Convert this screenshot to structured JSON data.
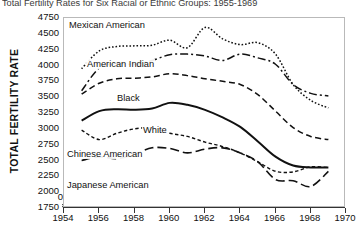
{
  "chart_data": {
    "type": "line",
    "title": "Total Fertility Rates for Six Racial or Ethnic Groups: 1955-1969",
    "xlabel": "",
    "ylabel": "TOTAL FERTILITY RATE",
    "xlim": [
      1954,
      1970
    ],
    "ylim": [
      1750,
      4750
    ],
    "grid": false,
    "legend_position": "in-plot labels",
    "x_ticks": [
      "1954",
      "1956",
      "1958",
      "1960",
      "1962",
      "1964",
      "1966",
      "1968",
      "1970"
    ],
    "y_ticks": [
      "1750",
      "2000",
      "2250",
      "2500",
      "2750",
      "3000",
      "3250",
      "3500",
      "3750",
      "4000",
      "4250",
      "4500",
      "4750"
    ],
    "y_zero_tick": "0",
    "x": [
      1955,
      1956,
      1957,
      1958,
      1959,
      1960,
      1961,
      1962,
      1963,
      1964,
      1965,
      1966,
      1967,
      1968,
      1969
    ],
    "series": [
      {
        "name": "Mexican American",
        "style": "dotted",
        "values": [
          3950,
          4230,
          4300,
          4310,
          4320,
          4400,
          4280,
          4600,
          4420,
          4330,
          4360,
          4180,
          3700,
          3450,
          3330
        ]
      },
      {
        "name": "American Indian",
        "style": "dash-dot",
        "values": [
          3600,
          3960,
          4030,
          4020,
          4080,
          4170,
          4180,
          4150,
          4080,
          4180,
          4120,
          4020,
          3700,
          3560,
          3520
        ]
      },
      {
        "name": "Black",
        "style": "dashed",
        "values": [
          3550,
          3720,
          3790,
          3800,
          3820,
          3870,
          3840,
          3790,
          3750,
          3700,
          3540,
          3280,
          3020,
          2880,
          2830
        ]
      },
      {
        "name": "White",
        "style": "solid",
        "values": [
          3130,
          3280,
          3310,
          3300,
          3320,
          3410,
          3380,
          3300,
          3180,
          3030,
          2800,
          2560,
          2420,
          2390,
          2390
        ]
      },
      {
        "name": "Chinese American",
        "style": "short-dash",
        "values": [
          2980,
          2830,
          2930,
          3000,
          3010,
          2930,
          2880,
          2790,
          2720,
          2620,
          2480,
          2330,
          2320,
          2400,
          2390
        ]
      },
      {
        "name": "Japanese American",
        "style": "long-dash",
        "values": [
          2500,
          2560,
          2530,
          2600,
          2700,
          2690,
          2620,
          2680,
          2700,
          2620,
          2480,
          2200,
          2180,
          2090,
          2330
        ]
      }
    ],
    "series_label_positions": [
      {
        "name": "Mexican American",
        "left": 4,
        "top": 2
      },
      {
        "name": "American Indian",
        "left": 22,
        "top": 41
      },
      {
        "name": "Black",
        "left": 52,
        "top": 75
      },
      {
        "name": "White",
        "left": 78,
        "top": 107
      },
      {
        "name": "Chinese American",
        "left": 2,
        "top": 131
      },
      {
        "name": "Japanese American",
        "left": 2,
        "top": 162
      }
    ],
    "colors": {
      "line": "#111111",
      "frame": "#b9b9b9",
      "background": "#ffffff"
    }
  },
  "caption": {
    "text": ""
  }
}
